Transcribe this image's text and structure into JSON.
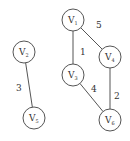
{
  "diagram": {
    "type": "weighted-undirected-graph",
    "nodes": [
      {
        "id": "V1",
        "letter": "V",
        "sub": "1",
        "x": 73,
        "y": 20
      },
      {
        "id": "V2",
        "letter": "V",
        "sub": "2",
        "x": 24,
        "y": 52
      },
      {
        "id": "V3",
        "letter": "V",
        "sub": "3",
        "x": 73,
        "y": 75
      },
      {
        "id": "V4",
        "letter": "V",
        "sub": "4",
        "x": 110,
        "y": 57
      },
      {
        "id": "V5",
        "letter": "V",
        "sub": "5",
        "x": 34,
        "y": 118
      },
      {
        "id": "V6",
        "letter": "V",
        "sub": "6",
        "x": 110,
        "y": 120
      }
    ],
    "edges": [
      {
        "from": "V1",
        "to": "V4",
        "weight": "5",
        "label_x": 96,
        "label_y": 28
      },
      {
        "from": "V1",
        "to": "V3",
        "weight": "1",
        "label_x": 80,
        "label_y": 55
      },
      {
        "from": "V2",
        "to": "V5",
        "weight": "3",
        "label_x": 16,
        "label_y": 91
      },
      {
        "from": "V3",
        "to": "V6",
        "weight": "4",
        "label_x": 91,
        "label_y": 92
      },
      {
        "from": "V4",
        "to": "V6",
        "weight": "2",
        "label_x": 114,
        "label_y": 99
      }
    ],
    "node_radius": 11,
    "colors": {
      "stroke": "#555555",
      "text": "#333333",
      "background": "#ffffff"
    }
  }
}
